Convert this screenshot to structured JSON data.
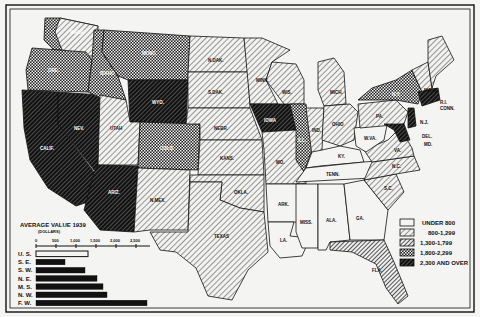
{
  "map": {
    "subject": "Average value per farm, 1939, by state",
    "states": [
      {
        "abbr": "WASH",
        "class": "1,800-2,299"
      },
      {
        "abbr": "ORE",
        "class": "1,800-2,299"
      },
      {
        "abbr": "CALIF",
        "class": "2,300 AND OVER"
      },
      {
        "abbr": "IDAHO",
        "class": "1,800-2,299"
      },
      {
        "abbr": "NEV",
        "class": "2,300 AND OVER"
      },
      {
        "abbr": "MONT",
        "class": "1,800-2,299"
      },
      {
        "abbr": "WYO",
        "class": "2,300 AND OVER"
      },
      {
        "abbr": "UTAH",
        "class": "1,300-1,799"
      },
      {
        "abbr": "ARIZ",
        "class": "2,300 AND OVER"
      },
      {
        "abbr": "COLO",
        "class": "1,800-2,299"
      },
      {
        "abbr": "N.MEX",
        "class": "1,300-1,799"
      },
      {
        "abbr": "N.DAK",
        "class": "1,300-1,799"
      },
      {
        "abbr": "S.DAK",
        "class": "1,300-1,799"
      },
      {
        "abbr": "NEBR",
        "class": "1,300-1,799"
      },
      {
        "abbr": "KANS",
        "class": "1,300-1,799"
      },
      {
        "abbr": "OKLA",
        "class": "800-1,299"
      },
      {
        "abbr": "TEXAS",
        "class": "800-1,299"
      },
      {
        "abbr": "MINN",
        "class": "1,300-1,799"
      },
      {
        "abbr": "IOWA",
        "class": "2,300 AND OVER"
      },
      {
        "abbr": "MO",
        "class": "800-1,299"
      },
      {
        "abbr": "ARK",
        "class": "UNDER 800"
      },
      {
        "abbr": "LA",
        "class": "UNDER 800"
      },
      {
        "abbr": "WIS",
        "class": "1,300-1,799"
      },
      {
        "abbr": "ILL",
        "class": "1,800-2,299"
      },
      {
        "abbr": "MICH",
        "class": "800-1,299"
      },
      {
        "abbr": "IND",
        "class": "1,300-1,799"
      },
      {
        "abbr": "OHIO",
        "class": "800-1,299"
      },
      {
        "abbr": "KY",
        "class": "UNDER 800"
      },
      {
        "abbr": "TENN",
        "class": "UNDER 800"
      },
      {
        "abbr": "MISS",
        "class": "UNDER 800"
      },
      {
        "abbr": "ALA",
        "class": "UNDER 800"
      },
      {
        "abbr": "GA",
        "class": "UNDER 800"
      },
      {
        "abbr": "FLA",
        "class": "1,300-1,799"
      },
      {
        "abbr": "S.C",
        "class": "800-1,299"
      },
      {
        "abbr": "N.C",
        "class": "800-1,299"
      },
      {
        "abbr": "VA",
        "class": "800-1,299"
      },
      {
        "abbr": "W.VA",
        "class": "UNDER 800"
      },
      {
        "abbr": "PA",
        "class": "1,300-1,799"
      },
      {
        "abbr": "N.Y",
        "class": "1,800-2,299"
      },
      {
        "abbr": "VT",
        "class": "800-1,299"
      },
      {
        "abbr": "N.H",
        "class": "800-1,299"
      },
      {
        "abbr": "ME",
        "class": "800-1,299"
      },
      {
        "abbr": "MASS",
        "class": "2,300 AND OVER"
      },
      {
        "abbr": "R.I",
        "class": "2,300 AND OVER"
      },
      {
        "abbr": "CONN",
        "class": "2,300 AND OVER"
      },
      {
        "abbr": "N.J",
        "class": "2,300 AND OVER"
      },
      {
        "abbr": "DEL",
        "class": "1,300-1,799"
      },
      {
        "abbr": "MD",
        "class": "1,800-2,299"
      }
    ],
    "labels": {
      "WASH": "WASH.",
      "ORE": "ORE.",
      "CALIF": "CALIF.",
      "IDAHO": "IDAHO",
      "NEV": "NEV.",
      "MONT": "MONT.",
      "WYO": "WYO.",
      "UTAH": "UTAH",
      "ARIZ": "ARIZ.",
      "COLO": "COLO.",
      "NMEX": "N.MEX.",
      "NDAK": "N.DAK.",
      "SDAK": "S.DAK.",
      "NEBR": "NEBR.",
      "KANS": "KANS.",
      "OKLA": "OKLA.",
      "TEXAS": "TEXAS",
      "MINN": "MINN.",
      "IOWA": "IOWA",
      "MO": "MO.",
      "ARK": "ARK.",
      "LA": "LA.",
      "WIS": "WIS.",
      "ILL": "ILL.",
      "MICH": "MICH.",
      "IND": "IND.",
      "OHIO": "OHIO",
      "KY": "KY.",
      "TENN": "TENN.",
      "MISS": "MISS.",
      "ALA": "ALA.",
      "GA": "GA.",
      "FLA": "FLA.",
      "SC": "S.C.",
      "NC": "N.C.",
      "VA": "VA.",
      "WVA": "W.VA.",
      "PA": "PA.",
      "NY": "N.Y.",
      "VT": "VT.",
      "NH": "N.H.",
      "ME": "ME.",
      "MASS": "MASS.",
      "RI": "R.I.",
      "CONN": "CONN.",
      "NJ": "N.J.",
      "DEL": "DEL.",
      "MD": "MD."
    }
  },
  "legend": {
    "items": [
      {
        "label": "UNDER 800",
        "pattern": "blank"
      },
      {
        "label": "800-1,299",
        "pattern": "light-hatch"
      },
      {
        "label": "1,300-1,799",
        "pattern": "medium-hatch"
      },
      {
        "label": "1,800-2,299",
        "pattern": "crosshatch"
      },
      {
        "label": "2,300 AND OVER",
        "pattern": "dark-hatch"
      }
    ]
  },
  "chart_data": {
    "type": "bar",
    "orientation": "horizontal",
    "title": "AVERAGE VALUE 1939",
    "subtitle": "(DOLLARS)",
    "categories": [
      "U. S.",
      "S. E.",
      "S. W.",
      "N. E.",
      "M. S.",
      "N. W.",
      "F. W."
    ],
    "values": [
      1300,
      725,
      1225,
      1525,
      1675,
      1775,
      2775
    ],
    "highlight": {
      "U. S.": "outline"
    },
    "xlabel": "",
    "ylabel": "",
    "xticks": [
      "0",
      "500",
      "1,000",
      "1,500",
      "2,000",
      "2,500"
    ],
    "xlim": [
      0,
      2800
    ],
    "grid": false
  }
}
